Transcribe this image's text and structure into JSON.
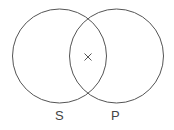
{
  "diagram": {
    "type": "venn",
    "stroke_color": "#555555",
    "circles": [
      {
        "label": "S",
        "cx": 59.5,
        "cy": 56,
        "r": 47
      },
      {
        "label": "P",
        "cx": 116.5,
        "cy": 56,
        "r": 47
      }
    ],
    "marker": {
      "symbol": "×",
      "region": "S∩P",
      "x": 88,
      "y": 57
    }
  }
}
